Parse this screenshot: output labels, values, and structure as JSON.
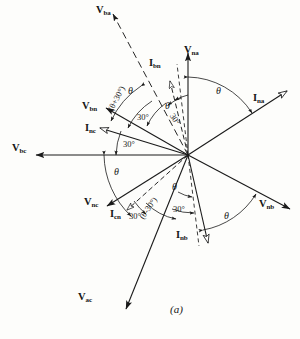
{
  "figure": {
    "caption": "(a)",
    "origin": {
      "x": 188,
      "y": 155
    },
    "stroke_color": "#1a1a1a",
    "background": "#fdfdfb"
  },
  "phasors": [
    {
      "name": "V_ba",
      "label": "V",
      "sub": "ba",
      "kind": "voltage",
      "style": "dashed",
      "angle_deg": 118,
      "length": 160,
      "label_x": 96,
      "label_y": 4
    },
    {
      "name": "V_na",
      "label": "V",
      "sub": "na",
      "kind": "voltage",
      "style": "solid",
      "angle_deg": 90,
      "length": 106,
      "label_x": 184,
      "label_y": 44
    },
    {
      "name": "I_bn",
      "label": "I",
      "sub": "bn",
      "kind": "current",
      "style": "dashed",
      "angle_deg": 104,
      "length": 76,
      "label_x": 149,
      "label_y": 57
    },
    {
      "name": "I_na",
      "label": "I",
      "sub": "na",
      "kind": "current",
      "style": "solid",
      "angle_deg": 33,
      "length": 118,
      "label_x": 253,
      "label_y": 92
    },
    {
      "name": "V_bn",
      "label": "V",
      "sub": "bn",
      "kind": "voltage",
      "style": "solid",
      "angle_deg": 150,
      "length": 95,
      "label_x": 82,
      "label_y": 100
    },
    {
      "name": "I_nc",
      "label": "I",
      "sub": "nc",
      "kind": "current",
      "style": "solid",
      "angle_deg": 163,
      "length": 92,
      "label_x": 85,
      "label_y": 122
    },
    {
      "name": "V_bc",
      "label": "V",
      "sub": "bc",
      "kind": "voltage",
      "style": "solid",
      "angle_deg": 180,
      "length": 168,
      "label_x": 12,
      "label_y": 142
    },
    {
      "name": "V_nc",
      "label": "V",
      "sub": "nc",
      "kind": "voltage",
      "style": "solid",
      "angle_deg": 212,
      "length": 96,
      "label_x": 84,
      "label_y": 196
    },
    {
      "name": "I_cn",
      "label": "I",
      "sub": "cn",
      "kind": "current",
      "style": "dashed",
      "angle_deg": 222,
      "length": 82,
      "label_x": 110,
      "label_y": 208
    },
    {
      "name": "V_ac",
      "label": "V",
      "sub": "ac",
      "kind": "voltage",
      "style": "solid",
      "angle_deg": 248,
      "length": 166,
      "label_x": 78,
      "label_y": 291
    },
    {
      "name": "I_nb",
      "label": "I",
      "sub": "nb",
      "kind": "current",
      "style": "solid",
      "angle_deg": 283,
      "length": 90,
      "label_x": 176,
      "label_y": 229
    },
    {
      "name": "V_nb",
      "label": "V",
      "sub": "nb",
      "kind": "voltage",
      "style": "solid",
      "angle_deg": 332,
      "length": 115,
      "label_x": 259,
      "label_y": 198
    }
  ],
  "reference_dashes": [
    {
      "name": "vertical-down-dash",
      "angle_deg": 270,
      "length": 92
    },
    {
      "name": "upper-dash-guide",
      "angle_deg": 97,
      "length": 92
    }
  ],
  "angle_annotations": [
    {
      "name": "theta-na-ina",
      "text": "θ",
      "italic": true,
      "x": 216,
      "y": 85
    },
    {
      "name": "theta-ba-bn",
      "text": "θ",
      "italic": true,
      "x": 128,
      "y": 85
    },
    {
      "name": "theta-plus-30",
      "text": "(θ+30°)",
      "italic": false,
      "x": 118,
      "y": 104,
      "rotate": -62
    },
    {
      "name": "thirty-upper-mid",
      "text": "30°",
      "italic": false,
      "x": 139,
      "y": 111
    },
    {
      "name": "theta-upper-right",
      "text": "θ",
      "italic": true,
      "x": 165,
      "y": 101
    },
    {
      "name": "thirty-upper-right",
      "text": "30°",
      "italic": false,
      "x": 173,
      "y": 110,
      "rotate": 57
    },
    {
      "name": "thirty-left",
      "text": "30°",
      "italic": false,
      "x": 124,
      "y": 138
    },
    {
      "name": "theta-bc-nc",
      "text": "θ",
      "italic": true,
      "x": 114,
      "y": 168
    },
    {
      "name": "thirty-lower-left",
      "text": "30°",
      "italic": false,
      "x": 130,
      "y": 211
    },
    {
      "name": "theta-minus-30",
      "text": "(θ-30°)",
      "italic": false,
      "x": 141,
      "y": 212,
      "rotate": -55
    },
    {
      "name": "thirty-lower-mid",
      "text": "30°",
      "italic": false,
      "x": 174,
      "y": 205
    },
    {
      "name": "theta-lower-center",
      "text": "θ",
      "italic": true,
      "x": 173,
      "y": 182
    },
    {
      "name": "theta-inb-vnb",
      "text": "θ",
      "italic": true,
      "x": 224,
      "y": 211
    }
  ]
}
